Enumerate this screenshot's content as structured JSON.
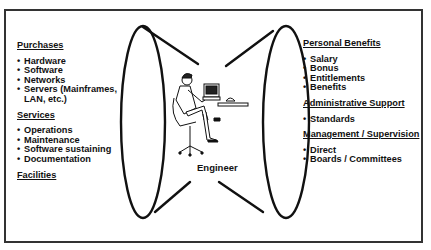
{
  "left_panel": {
    "sections": [
      {
        "heading": "Purchases",
        "items": [
          "Hardware",
          "Software",
          "Networks",
          "Servers (Mainframes, LAN, etc.)"
        ]
      },
      {
        "heading": "Services",
        "items": [
          "Operations",
          "Maintenance",
          "Software sustaining",
          "Documentation"
        ]
      },
      {
        "heading": "Facilities",
        "items": []
      }
    ]
  },
  "right_panel": {
    "sections": [
      {
        "heading": "Personal Benefits",
        "items": [
          "Salary",
          "Bonus",
          "Entitlements",
          "Benefits"
        ]
      },
      {
        "heading": "Administrative Support",
        "items": [
          "Standards"
        ]
      },
      {
        "heading": "Management / Supervision",
        "items": [
          "Direct",
          "Boards / Committees"
        ]
      }
    ]
  },
  "center": {
    "label": "Engineer",
    "illustration": "engineer-at-desk-icon"
  }
}
